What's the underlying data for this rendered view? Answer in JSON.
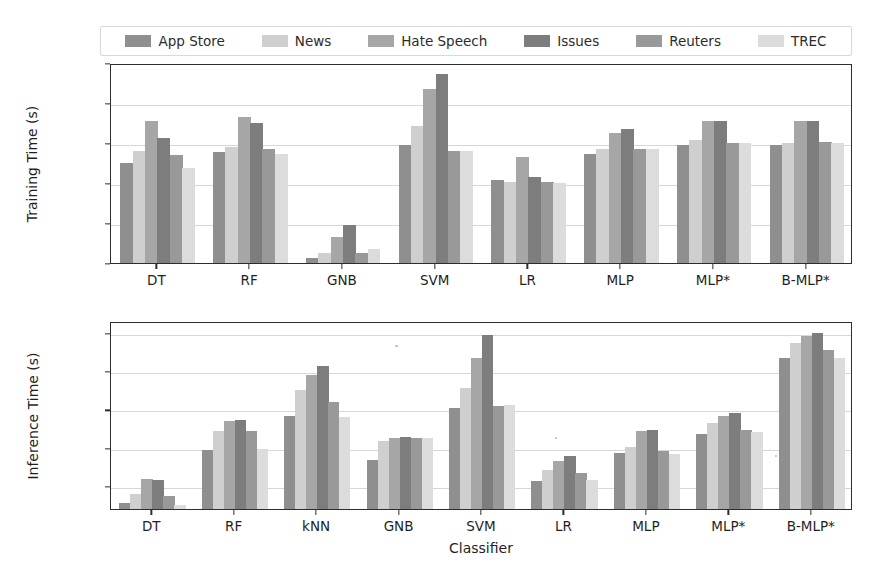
{
  "legend": {
    "position": "upper-center-outside",
    "entries": [
      {
        "label": "App Store",
        "color": "#8f8f8f"
      },
      {
        "label": "News",
        "color": "#cfcfcf"
      },
      {
        "label": "Hate Speech",
        "color": "#a6a6a6"
      },
      {
        "label": "Issues",
        "color": "#7d7d7d"
      },
      {
        "label": "Reuters",
        "color": "#999999"
      },
      {
        "label": "TREC",
        "color": "#dcdcdc"
      }
    ]
  },
  "chart_data": [
    {
      "type": "bar",
      "title": "",
      "xlabel": "",
      "ylabel": "Training Time (s)",
      "yscale": "log",
      "ylim": [
        0.01,
        1000
      ],
      "yticks": [
        0.01,
        0.1,
        1,
        10,
        100,
        1000
      ],
      "ytick_labels": [
        "10⁻²",
        "10⁻¹",
        "10⁰",
        "10¹",
        "10²",
        "10³"
      ],
      "grid": true,
      "categories": [
        "DT",
        "RF",
        "GNB",
        "SVM",
        "LR",
        "MLP",
        "MLP*",
        "B-MLP*"
      ],
      "series": [
        {
          "name": "App Store",
          "values": [
            3.5,
            6.5,
            0.015,
            10,
            1.3,
            6,
            10,
            10
          ]
        },
        {
          "name": "News",
          "values": [
            7,
            9,
            0.02,
            30,
            1.2,
            8,
            13,
            11
          ]
        },
        {
          "name": "Hate Speech",
          "values": [
            40,
            50,
            0.05,
            250,
            5,
            20,
            40,
            40
          ]
        },
        {
          "name": "Issues",
          "values": [
            15,
            35,
            0.1,
            600,
            1.6,
            25,
            40,
            40
          ]
        },
        {
          "name": "Reuters",
          "values": [
            5.5,
            8,
            0.02,
            7,
            1.2,
            8,
            11,
            12
          ]
        },
        {
          "name": "TREC",
          "values": [
            2.6,
            6,
            0.025,
            7,
            1.15,
            8,
            11,
            11.5
          ]
        }
      ]
    },
    {
      "type": "bar",
      "title": "",
      "xlabel": "Classifier",
      "ylabel": "Inference Time (s)",
      "yscale": "log",
      "ylim": [
        0.0025,
        200
      ],
      "yticks": [
        0.01,
        0.1,
        1,
        10,
        100
      ],
      "ytick_labels": [
        "10⁻²",
        "10⁻¹",
        "10⁰",
        "10¹",
        "10²"
      ],
      "grid": true,
      "categories": [
        "DT",
        "RF",
        "kNN",
        "GNB",
        "SVM",
        "LR",
        "MLP",
        "MLP*",
        "B-MLP*"
      ],
      "series": [
        {
          "name": "App Store",
          "values": [
            0.004,
            0.1,
            0.75,
            0.055,
            1.2,
            0.015,
            0.08,
            0.25,
            25
          ]
        },
        {
          "name": "News",
          "values": [
            0.007,
            0.3,
            3.5,
            0.17,
            4,
            0.03,
            0.12,
            0.5,
            60
          ]
        },
        {
          "name": "Hate Speech",
          "values": [
            0.017,
            0.55,
            9,
            0.2,
            25,
            0.05,
            0.3,
            0.75,
            90
          ]
        },
        {
          "name": "Issues",
          "values": [
            0.016,
            0.6,
            15,
            0.21,
            100,
            0.07,
            0.32,
            0.9,
            110
          ]
        },
        {
          "name": "Reuters",
          "values": [
            0.006,
            0.3,
            1.7,
            0.2,
            1.4,
            0.025,
            0.09,
            0.32,
            40
          ]
        },
        {
          "name": "TREC",
          "values": [
            0.0035,
            0.105,
            0.7,
            0.2,
            1.45,
            0.016,
            0.075,
            0.28,
            25
          ]
        }
      ]
    }
  ]
}
